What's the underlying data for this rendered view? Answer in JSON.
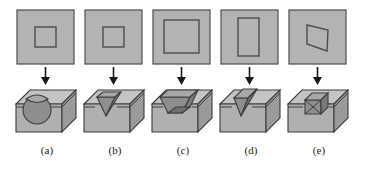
{
  "figure": {
    "type": "technical-diagram",
    "background_color": "#ffffff",
    "palette": {
      "plate_fill": "#b3b3b3",
      "plate_stroke": "#4d4d4d",
      "inner_outline_stroke": "#4d4d4d",
      "block_top_fill": "#c4c4c4",
      "block_front_fill": "#b0b0b0",
      "block_side_fill": "#9a9a9a",
      "cavity_fill_light": "#a8a8a8",
      "cavity_fill_mid": "#8e8e8e",
      "cavity_fill_dark": "#7a7a7a",
      "block_stroke": "#3d3d3d",
      "arrow_color": "#1a1a1a",
      "caption_color": "#1a1a1a"
    },
    "columns": [
      {
        "id": "a",
        "caption": "(a)",
        "top_shape": "small-square",
        "cavity": "spherical-cylindrical-pocket",
        "arrow": "down-arrow"
      },
      {
        "id": "b",
        "caption": "(b)",
        "top_shape": "small-square",
        "cavity": "v-groove-triangular-pocket",
        "arrow": "down-arrow"
      },
      {
        "id": "c",
        "caption": "(c)",
        "top_shape": "large-square",
        "cavity": "tapered-trapezoidal-pocket",
        "arrow": "down-arrow"
      },
      {
        "id": "d",
        "caption": "(d)",
        "top_shape": "tall-rectangle",
        "cavity": "angled-v-pocket",
        "arrow": "down-arrow"
      },
      {
        "id": "e",
        "caption": "(e)",
        "top_shape": "parallelogram",
        "cavity": "skewed-oblique-pocket",
        "arrow": "down-arrow"
      }
    ]
  }
}
